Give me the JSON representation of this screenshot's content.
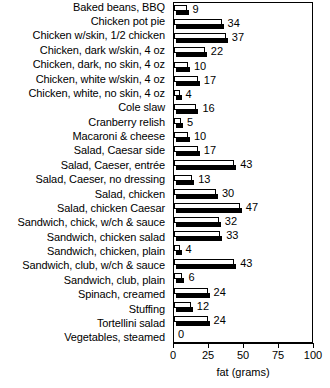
{
  "chart_data": {
    "type": "bar",
    "orientation": "horizontal",
    "title": "",
    "xlabel": "fat (grams)",
    "ylabel": "",
    "xlim": [
      0,
      100
    ],
    "xticks": [
      0,
      25,
      50,
      75,
      100
    ],
    "grid": false,
    "legend": null,
    "frame": true,
    "value_labels": true,
    "categories": [
      "Baked beans, BBQ",
      "Chicken pot pie",
      "Chicken w/skin, 1/2 chicken",
      "Chicken, dark w/skin, 4 oz",
      "Chicken, dark, no skin, 4 oz",
      "Chicken, white w/skin, 4 oz",
      "Chicken, white, no skin, 4 oz",
      "Cole slaw",
      "Cranberry relish",
      "Macaroni & cheese",
      "Salad, Caesar side",
      "Salad, Caeser, entrée",
      "Salad, Caeser, no dressing",
      "Salad, chicken",
      "Salad, chicken Caesar",
      "Sandwich, chick, w/ch & sauce",
      "Sandwich, chicken salad",
      "Sandwich, chicken, plain",
      "Sandwich, club, w/ch & sauce",
      "Sandwich, club, plain",
      "Spinach, creamed",
      "Stuffing",
      "Tortellini salad",
      "Vegetables, steamed"
    ],
    "values": [
      9,
      34,
      37,
      22,
      10,
      17,
      4,
      16,
      5,
      10,
      17,
      43,
      13,
      30,
      47,
      32,
      33,
      4,
      43,
      6,
      24,
      12,
      24,
      0
    ],
    "colors": {
      "bar_face": "#ffffff",
      "bar_outline": "#000000",
      "bar_shadow": "#000000",
      "axis": "#000000",
      "text": "#000000",
      "background": "#ffffff"
    }
  }
}
